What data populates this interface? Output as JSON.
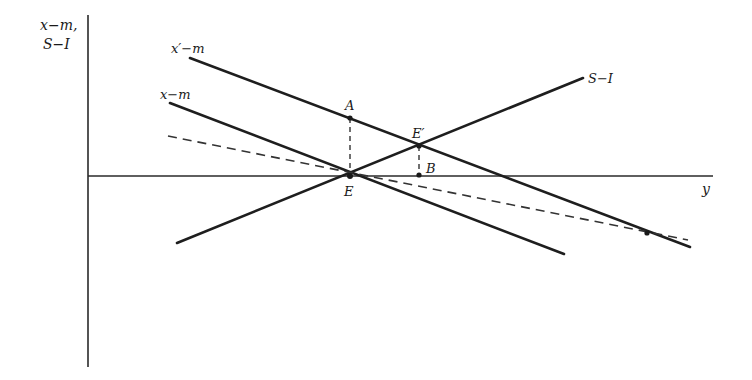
{
  "diagram": {
    "axes": {
      "y_axis_label_line1": "x−m,",
      "y_axis_label_line2": "S−I",
      "x_axis_label": "y"
    },
    "lines": [
      {
        "id": "x_prime_minus_m",
        "label": "x′−m",
        "style": "solid",
        "from": [
          190,
          58
        ],
        "to": [
          690,
          247
        ]
      },
      {
        "id": "x_minus_m",
        "label": "x−m",
        "style": "solid",
        "from": [
          170,
          103
        ],
        "to": [
          564,
          254
        ]
      },
      {
        "id": "s_minus_i",
        "label": "S−I",
        "style": "solid",
        "from": [
          177,
          243
        ],
        "to": [
          583,
          78
        ]
      },
      {
        "id": "dashed_line",
        "label": "",
        "style": "dashed",
        "from": [
          168,
          136
        ],
        "to": [
          688,
          240
        ]
      }
    ],
    "points": [
      {
        "id": "A",
        "label": "A",
        "at": [
          350,
          118
        ]
      },
      {
        "id": "E",
        "label": "E",
        "at": [
          350,
          176
        ]
      },
      {
        "id": "E_prime",
        "label": "E′",
        "at": [
          419,
          146
        ]
      },
      {
        "id": "B",
        "label": "B",
        "at": [
          419,
          175
        ]
      },
      {
        "id": "far_intersection",
        "label": "",
        "at": [
          647,
          233
        ]
      }
    ],
    "guides": [
      {
        "id": "A_to_E",
        "from": [
          350,
          118
        ],
        "to": [
          350,
          176
        ]
      },
      {
        "id": "E_prime_to_B",
        "from": [
          419,
          146
        ],
        "to": [
          419,
          175
        ]
      }
    ]
  }
}
